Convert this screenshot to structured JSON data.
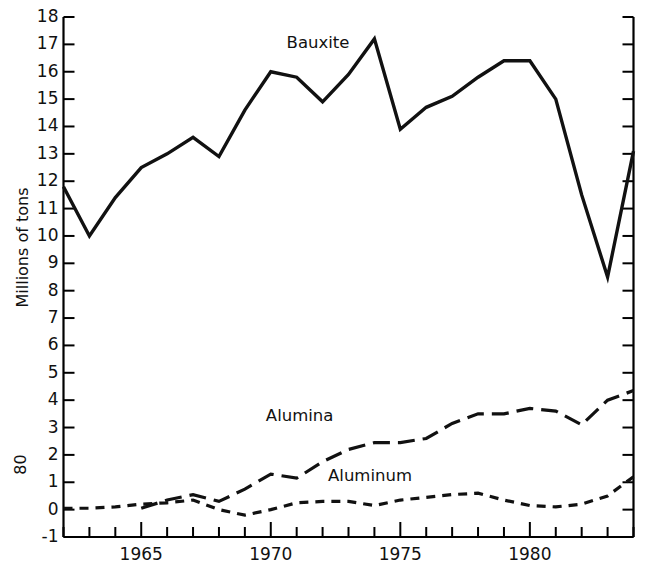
{
  "chart_data": {
    "type": "line",
    "title": "",
    "subtitle": "",
    "xlabel": "",
    "ylabel": "Millions of tons",
    "xlim": [
      1962,
      1984
    ],
    "ylim": [
      -1,
      18
    ],
    "yticks": [
      18,
      17,
      16,
      15,
      14,
      13,
      12,
      11,
      10,
      9,
      8,
      7,
      6,
      5,
      4,
      3,
      2,
      1,
      0,
      -1
    ],
    "ytick_labels": [
      "18",
      "17",
      "16",
      "15",
      "14",
      "13",
      "12",
      "11",
      "10",
      "9",
      "8",
      "7",
      "6",
      "5",
      "4",
      "3",
      "2",
      "1",
      "0",
      "-1"
    ],
    "xticks": [
      1962,
      1963,
      1964,
      1965,
      1966,
      1967,
      1968,
      1969,
      1970,
      1971,
      1972,
      1973,
      1974,
      1975,
      1976,
      1977,
      1978,
      1979,
      1980,
      1981,
      1982,
      1983,
      1984
    ],
    "xtick_labels": [
      "1965",
      "1970",
      "1975",
      "1980"
    ],
    "xtick_label_values": [
      1965,
      1970,
      1975,
      1980
    ],
    "major_xticks": [
      1965,
      1970,
      1975,
      1980
    ],
    "grid": false,
    "legend_position": "inline-annotations",
    "x": [
      1962,
      1963,
      1964,
      1965,
      1966,
      1967,
      1968,
      1969,
      1970,
      1971,
      1972,
      1973,
      1974,
      1975,
      1976,
      1977,
      1978,
      1979,
      1980,
      1981,
      1982,
      1983,
      1984
    ],
    "series": [
      {
        "name": "Bauxite",
        "dash": "solid",
        "label_x": 1972.0,
        "label_y": 17.0,
        "values": [
          11.8,
          10.0,
          11.4,
          12.5,
          13.0,
          13.6,
          12.9,
          14.6,
          16.0,
          15.8,
          14.9,
          15.9,
          17.2,
          13.9,
          14.7,
          15.1,
          15.8,
          16.4,
          16.4,
          15.0,
          11.5,
          8.5,
          13.1
        ]
      },
      {
        "name": "Alumina",
        "dash": "long-dash",
        "label_x": 1971.2,
        "label_y": 3.4,
        "start_year": 1965,
        "values": [
          null,
          null,
          null,
          0.05,
          0.35,
          0.55,
          0.3,
          0.75,
          1.3,
          1.15,
          1.75,
          2.2,
          2.45,
          2.45,
          2.6,
          3.15,
          3.5,
          3.5,
          3.7,
          3.6,
          3.1,
          4.0,
          4.35
        ]
      },
      {
        "name": "Aluminum",
        "dash": "short-dash",
        "label_x": 1973.6,
        "label_y": 1.2,
        "values": [
          0.05,
          0.05,
          0.1,
          0.2,
          0.25,
          0.35,
          0.0,
          -0.2,
          0.0,
          0.25,
          0.3,
          0.3,
          0.15,
          0.35,
          0.45,
          0.55,
          0.6,
          0.35,
          0.15,
          0.1,
          0.2,
          0.5,
          1.2
        ]
      }
    ]
  },
  "axis": {
    "y_title": "Millions of tons",
    "page_number": "80"
  },
  "style": {
    "line_color": "#111111",
    "axis_color": "#000000",
    "background": "#ffffff"
  }
}
